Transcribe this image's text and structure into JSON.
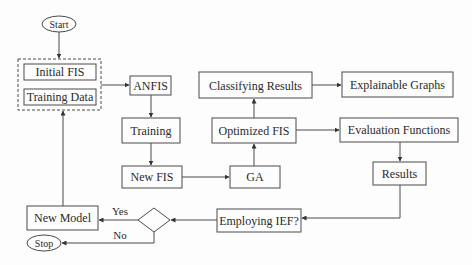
{
  "diagram": {
    "colors": {
      "stroke": "#4a4a4a",
      "text": "#2a2a2a",
      "background": "#fdfdfd"
    },
    "nodes": {
      "start": {
        "label": "Start",
        "shape": "ellipse"
      },
      "initial_fis": {
        "label": "Initial FIS",
        "shape": "rect"
      },
      "training_data": {
        "label": "Training Data",
        "shape": "rect"
      },
      "input_group": {
        "label": "",
        "shape": "dashed-rect"
      },
      "anfis": {
        "label": "ANFIS",
        "shape": "rect"
      },
      "training": {
        "label": "Training",
        "shape": "rect"
      },
      "new_fis": {
        "label": "New FIS",
        "shape": "rect"
      },
      "ga": {
        "label": "GA",
        "shape": "rect"
      },
      "optimized_fis": {
        "label": "Optimized FIS",
        "shape": "rect"
      },
      "classifying_results": {
        "label": "Classifying Results",
        "shape": "rect"
      },
      "explainable_graphs": {
        "label": "Explainable Graphs",
        "shape": "rect"
      },
      "evaluation_functions": {
        "label": "Evaluation Functions",
        "shape": "rect"
      },
      "results": {
        "label": "Results",
        "shape": "rect"
      },
      "employing_ief": {
        "label": "Employing IEF?",
        "shape": "rect"
      },
      "decision": {
        "label": "",
        "shape": "diamond"
      },
      "new_model": {
        "label": "New Model",
        "shape": "rect"
      },
      "stop": {
        "label": "Stop",
        "shape": "ellipse"
      }
    },
    "edges": [
      {
        "from": "start",
        "to": "input_group",
        "label": ""
      },
      {
        "from": "input_group",
        "to": "anfis",
        "label": ""
      },
      {
        "from": "anfis",
        "to": "training",
        "label": ""
      },
      {
        "from": "training",
        "to": "new_fis",
        "label": ""
      },
      {
        "from": "new_fis",
        "to": "ga",
        "label": ""
      },
      {
        "from": "ga",
        "to": "optimized_fis",
        "label": ""
      },
      {
        "from": "optimized_fis",
        "to": "classifying_results",
        "label": ""
      },
      {
        "from": "classifying_results",
        "to": "explainable_graphs",
        "label": ""
      },
      {
        "from": "optimized_fis",
        "to": "evaluation_functions",
        "label": ""
      },
      {
        "from": "evaluation_functions",
        "to": "results",
        "label": ""
      },
      {
        "from": "results",
        "to": "employing_ief",
        "label": ""
      },
      {
        "from": "employing_ief",
        "to": "decision",
        "label": ""
      },
      {
        "from": "decision",
        "to": "new_model",
        "label": "Yes"
      },
      {
        "from": "decision",
        "to": "stop",
        "label": "No"
      },
      {
        "from": "new_model",
        "to": "input_group",
        "label": ""
      }
    ],
    "edge_labels": {
      "yes": "Yes",
      "no": "No"
    }
  }
}
